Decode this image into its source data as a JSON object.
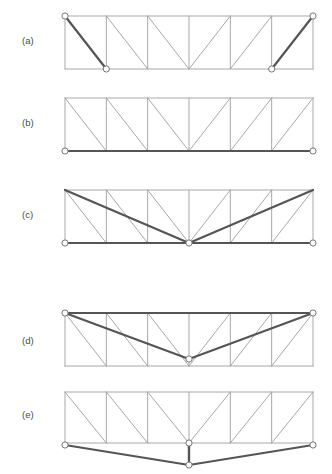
{
  "figure": {
    "title": "",
    "background_color": "#ffffff",
    "width": 332,
    "height": 474,
    "member_color": "#a8a8a8",
    "highlight_color": "#555555",
    "node_stroke_color": "#777777",
    "node_fill_color": "#ffffff",
    "label_color": "#4a4a4a"
  },
  "panels": [
    {
      "id": "a",
      "label": "(a)",
      "label_x": 22,
      "label_y": 44,
      "description": "Simply supported truss with supports at top-left and at interior bottom nodes; end diagonals highlighted",
      "geometry": {
        "left": 65,
        "right": 313,
        "top": 16,
        "bottom": 69,
        "bays": 6,
        "bay_width": 41.33
      },
      "diagonal_pattern": [
        "down",
        "down",
        "down",
        "up",
        "up",
        "up"
      ],
      "highlighted_members": [
        {
          "type": "diagonal",
          "x1": 65,
          "y1": 16,
          "x2": 106.3,
          "y2": 69
        },
        {
          "type": "diagonal",
          "x1": 271.7,
          "y1": 69,
          "x2": 313,
          "y2": 16
        }
      ],
      "nodes": [
        {
          "x": 65,
          "y": 16
        },
        {
          "x": 106.3,
          "y": 69
        },
        {
          "x": 271.7,
          "y": 69
        },
        {
          "x": 313,
          "y": 16
        }
      ]
    },
    {
      "id": "b",
      "label": "(b)",
      "label_x": 22,
      "label_y": 126,
      "description": "Truss with entire bottom chord highlighted, nodes at both bottom corners",
      "geometry": {
        "left": 65,
        "right": 313,
        "top": 98,
        "bottom": 151,
        "bays": 6,
        "bay_width": 41.33
      },
      "diagonal_pattern": [
        "down",
        "down",
        "down",
        "up",
        "up",
        "up"
      ],
      "highlighted_members": [
        {
          "type": "chord",
          "x1": 65,
          "y1": 151,
          "x2": 313,
          "y2": 151
        }
      ],
      "nodes": [
        {
          "x": 65,
          "y": 151
        },
        {
          "x": 313,
          "y": 151
        }
      ]
    },
    {
      "id": "c",
      "label": "(c)",
      "label_x": 22,
      "label_y": 218,
      "description": "Truss with deflected center bottom node; long diagonals from top corners to mid-span highlighted",
      "geometry": {
        "left": 65,
        "right": 313,
        "top": 190,
        "bottom": 243,
        "bays": 6,
        "bay_width": 41.33
      },
      "diagonal_pattern": [
        "down",
        "down",
        "down",
        "up",
        "up",
        "up"
      ],
      "highlighted_members": [
        {
          "type": "diagonal",
          "x1": 65,
          "y1": 190,
          "x2": 189,
          "y2": 243
        },
        {
          "type": "diagonal",
          "x1": 189,
          "y1": 243,
          "x2": 313,
          "y2": 190
        },
        {
          "type": "chord",
          "x1": 65,
          "y1": 243,
          "x2": 313,
          "y2": 243
        }
      ],
      "nodes": [
        {
          "x": 65,
          "y": 243
        },
        {
          "x": 189,
          "y": 243
        },
        {
          "x": 313,
          "y": 243
        }
      ]
    },
    {
      "id": "d",
      "label": "(d)",
      "label_x": 22,
      "label_y": 344,
      "description": "Truss supported at top corners; top chord and long diagonals to mid-span bottom node highlighted",
      "geometry": {
        "left": 65,
        "right": 313,
        "top": 313,
        "bottom": 366,
        "bays": 6,
        "bay_width": 41.33
      },
      "diagonal_pattern": [
        "down",
        "down",
        "down",
        "up",
        "up",
        "up"
      ],
      "highlighted_members": [
        {
          "type": "chord",
          "x1": 65,
          "y1": 313,
          "x2": 313,
          "y2": 313
        },
        {
          "type": "diagonal",
          "x1": 65,
          "y1": 313,
          "x2": 189,
          "y2": 359
        },
        {
          "type": "diagonal",
          "x1": 189,
          "y1": 359,
          "x2": 313,
          "y2": 313
        }
      ],
      "nodes": [
        {
          "x": 65,
          "y": 313
        },
        {
          "x": 189,
          "y": 359
        },
        {
          "x": 313,
          "y": 313
        }
      ]
    },
    {
      "id": "e",
      "label": "(e)",
      "label_x": 22,
      "label_y": 418,
      "description": "Truss with bottom chord displaced downward at mid-span via a short vertical member",
      "geometry": {
        "left": 65,
        "right": 313,
        "top": 392,
        "bottom": 443,
        "bays": 6,
        "bay_width": 41.33
      },
      "diagonal_pattern": [
        "down",
        "down",
        "down",
        "up",
        "up",
        "up"
      ],
      "highlighted_members": [
        {
          "type": "chord",
          "x1": 65,
          "y1": 445,
          "x2": 189,
          "y2": 465
        },
        {
          "type": "chord",
          "x1": 189,
          "y1": 465,
          "x2": 313,
          "y2": 445
        },
        {
          "type": "vertical",
          "x1": 189,
          "y1": 443,
          "x2": 189,
          "y2": 465
        }
      ],
      "nodes": [
        {
          "x": 65,
          "y": 445
        },
        {
          "x": 189,
          "y": 443
        },
        {
          "x": 313,
          "y": 445
        },
        {
          "x": 189,
          "y": 465
        }
      ]
    }
  ]
}
